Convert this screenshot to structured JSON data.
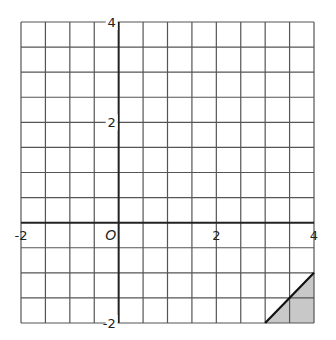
{
  "diagram": {
    "type": "coordinate-grid",
    "x_range": [
      -2,
      4
    ],
    "y_range": [
      -2,
      4
    ],
    "grid_step": 0.5,
    "origin_label": "O",
    "x_tick_labels": [
      {
        "value": -2,
        "text": "-2"
      },
      {
        "value": 2,
        "text": "2"
      },
      {
        "value": 4,
        "text": "4"
      }
    ],
    "y_tick_labels": [
      {
        "value": 4,
        "text": "4"
      },
      {
        "value": 2,
        "text": "2"
      },
      {
        "value": -2,
        "text": "-2"
      }
    ],
    "shaded_region": {
      "vertices": [
        [
          3,
          -2
        ],
        [
          4,
          -1
        ],
        [
          4,
          -2
        ]
      ],
      "fill": "#c8c8c8"
    },
    "line_segment": {
      "from": [
        3,
        -2
      ],
      "to": [
        4,
        -1
      ],
      "color": "#111111"
    },
    "colors": {
      "grid": "#555555",
      "axis": "#222222"
    }
  }
}
